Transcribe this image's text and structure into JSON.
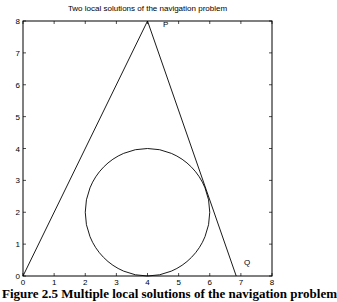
{
  "chart_data": {
    "type": "line",
    "title": "Two local solutions of the navigation problem",
    "xlabel": "",
    "ylabel": "",
    "xlim": [
      0,
      8
    ],
    "ylim": [
      0,
      8
    ],
    "xticks": [
      "0",
      "1",
      "2",
      "3",
      "4",
      "5",
      "6",
      "7",
      "8"
    ],
    "yticks": [
      "0",
      "1",
      "2",
      "3",
      "4",
      "5",
      "6",
      "7",
      "8"
    ],
    "grid": false,
    "series": [
      {
        "name": "left path",
        "x": [
          0,
          4
        ],
        "y": [
          0,
          8
        ]
      },
      {
        "name": "right path",
        "x": [
          4,
          6.85
        ],
        "y": [
          8,
          0
        ]
      },
      {
        "name": "obstacle circle",
        "center": [
          4,
          2
        ],
        "radius": 2
      }
    ],
    "annotations": [
      {
        "text": "P",
        "x": 4.5,
        "y": 7.8
      },
      {
        "text": "Q",
        "x": 7.1,
        "y": 0.35
      }
    ]
  },
  "caption": "Figure 2.5  Multiple local solutions of the navigation problem"
}
